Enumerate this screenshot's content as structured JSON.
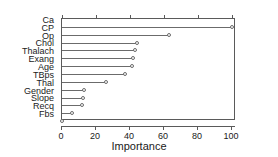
{
  "chart_data": {
    "type": "bar",
    "subtype": "lollipop-horizontal",
    "title": "",
    "subtitle": "",
    "xlabel": "Importance",
    "ylabel": "",
    "xlim": [
      0,
      102.4
    ],
    "ylim": [
      0,
      13
    ],
    "grid": false,
    "legend": null,
    "orientation": "horizontal",
    "xticks": [
      0,
      20,
      40,
      60,
      80,
      100
    ],
    "xticklabels": [
      "0",
      "20",
      "40",
      "60",
      "80",
      "100"
    ],
    "categories": [
      "Ca",
      "CP",
      "Op",
      "Chol",
      "Thalach",
      "Exang",
      "Age",
      "TBps",
      "Thal",
      "Gender",
      "Slope",
      "Recq",
      "Fbs"
    ],
    "values": [
      100,
      63,
      44,
      43,
      42,
      41,
      37,
      26,
      13,
      12.5,
      11.5,
      6,
      0
    ],
    "marker": "open-circle",
    "series": [
      {
        "name": "Importance",
        "values": [
          100,
          63,
          44,
          43,
          42,
          41,
          37,
          26,
          13,
          12.5,
          11.5,
          6,
          0
        ]
      }
    ],
    "colors": {
      "stem": "#6b6b6b",
      "marker_edge": "#6b6b6b",
      "marker_face": "#ffffff",
      "axis": "#5a5a5a",
      "text": "#1a1a1a",
      "background": "#ffffff"
    }
  }
}
